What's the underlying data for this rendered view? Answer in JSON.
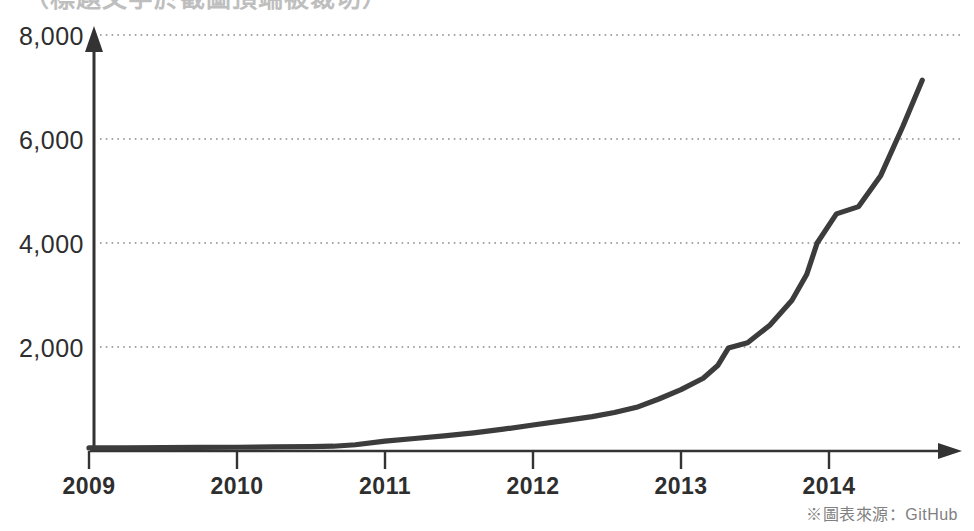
{
  "page": {
    "background_color": "#ffffff",
    "source_note": "※圖表來源：GitHub",
    "cropped_header_text": "（標題文字於截圖頂端被裁切）"
  },
  "chart_data": {
    "type": "line",
    "title": "",
    "subtitle": "",
    "xlabel": "",
    "ylabel": "",
    "series_name": "GitHub repositories (thousands)",
    "line_color": "#3c3c3c",
    "grid": true,
    "grid_color": "#aaaaaa",
    "grid_style": "dotted",
    "legend_position": "none",
    "axis_color": "#333333",
    "xlim": [
      2009,
      2014.65
    ],
    "ylim": [
      0,
      8400
    ],
    "y_ticks": [
      2000,
      4000,
      6000,
      8000
    ],
    "y_tick_labels": [
      "2,000",
      "4,000",
      "6,000",
      "8,000"
    ],
    "x_ticks": [
      2009,
      2010,
      2011,
      2012,
      2013,
      2014
    ],
    "x_tick_labels": [
      "2009",
      "2010",
      "2011",
      "2012",
      "2013",
      "2014"
    ],
    "x": [
      2009.0,
      2009.25,
      2009.5,
      2009.75,
      2010.0,
      2010.25,
      2010.5,
      2010.65,
      2010.8,
      2011.0,
      2011.2,
      2011.4,
      2011.6,
      2011.8,
      2012.0,
      2012.2,
      2012.4,
      2012.55,
      2012.7,
      2012.85,
      2013.0,
      2013.15,
      2013.25,
      2013.32,
      2013.45,
      2013.6,
      2013.75,
      2013.85,
      2013.92,
      2014.05,
      2014.2,
      2014.35,
      2014.5,
      2014.63
    ],
    "values": [
      60,
      62,
      65,
      68,
      72,
      78,
      85,
      92,
      120,
      190,
      240,
      290,
      350,
      420,
      500,
      580,
      660,
      740,
      840,
      1000,
      1180,
      1400,
      1650,
      1980,
      2080,
      2420,
      2900,
      3400,
      4000,
      4560,
      4700,
      5300,
      6250,
      7130
    ],
    "annotations": []
  },
  "axes": {
    "y_axis_name": "vertical-value-axis",
    "x_axis_name": "horizontal-year-axis",
    "y_axis_has_arrow": true,
    "x_axis_has_arrow": true
  }
}
